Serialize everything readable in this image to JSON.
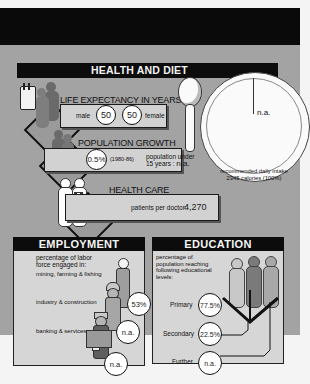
{
  "header_band": {
    "color": "#0a0a0a"
  },
  "health_and_diet": {
    "title": "HEALTH AND DIET",
    "life_expectancy": {
      "title": "LIFE EXPECTANCY IN YEARS",
      "male_label": "male",
      "male_value": "50",
      "female_value": "50",
      "female_label": "female"
    },
    "population_growth": {
      "title": "POPULATION GROWTH",
      "rate": "0.5%",
      "period": "(1980-86)",
      "under15_label_line1": "population under",
      "under15_label_line2": "15 years :",
      "under15_value": "n.a."
    },
    "health_care": {
      "title": "HEALTH CARE",
      "patients_label": "patients per doctor:",
      "patients_value": "4,270"
    },
    "diet": {
      "plate_value": "n.a.",
      "caption_line1": "recommended daily intake",
      "caption_line2": "2345 calories (100%)"
    }
  },
  "employment": {
    "title": "EMPLOYMENT",
    "intro_line1": "percentage of labor",
    "intro_line2": "force engaged in:",
    "rows": [
      {
        "label": "mining, farming & fishing",
        "value": "53%"
      },
      {
        "label": "industry & construction",
        "value": "n.a."
      },
      {
        "label": "banking & services",
        "value": "n.a."
      }
    ]
  },
  "education": {
    "title": "EDUCATION",
    "intro_line1": "percentage of",
    "intro_line2": "population reaching",
    "intro_line3": "following educational",
    "intro_line4": "levels:",
    "levels": [
      {
        "label": "Primary",
        "value": "77.5%"
      },
      {
        "label": "Secondary",
        "value": "22.5%"
      },
      {
        "label": "Further",
        "value": "n.a."
      }
    ]
  }
}
